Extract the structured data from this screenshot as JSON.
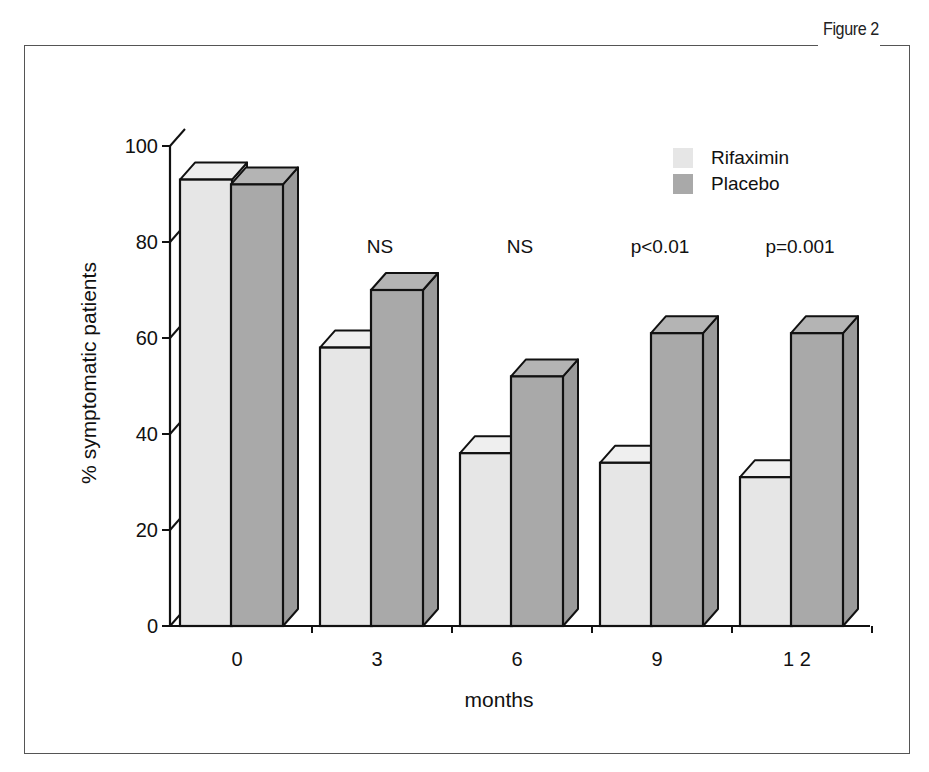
{
  "figure": {
    "label": "Figure 2"
  },
  "chart_data": {
    "type": "bar",
    "style": "3d-grouped",
    "title": "",
    "xlabel": "months",
    "ylabel": "% symptomatic patients",
    "categories": [
      "0",
      "3",
      "6",
      "9",
      "12"
    ],
    "y_ticks": [
      "0",
      "20",
      "40",
      "60",
      "80",
      "100"
    ],
    "ylim": [
      0,
      100
    ],
    "grid": false,
    "legend_position": "top-right",
    "series": [
      {
        "name": "Rifaximin",
        "color": "#e6e6e6",
        "values": [
          93,
          58,
          36,
          34,
          31
        ]
      },
      {
        "name": "Placebo",
        "color": "#a9a9a9",
        "values": [
          92,
          70,
          52,
          61,
          61
        ]
      }
    ],
    "annotations": [
      "",
      "NS",
      "NS",
      "p<0.01",
      "p=0.001"
    ]
  }
}
